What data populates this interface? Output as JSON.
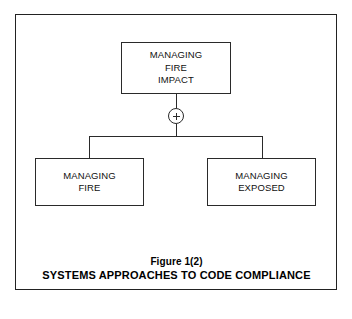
{
  "figure": {
    "caption_figure_number": "Figure 1(2)",
    "caption_title": "SYSTEMS APPROACHES TO CODE COMPLIANCE",
    "top_edge_remnant": "",
    "border_color": "#222222",
    "line_color": "#2a2a2a",
    "background_color": "#ffffff"
  },
  "nodes": {
    "top": {
      "name": "managing-fire-impact",
      "line1": "MANAGING",
      "line2": "FIRE",
      "line3": "IMPACT"
    },
    "left": {
      "name": "managing-fire",
      "line1": "MANAGING",
      "line2": "FIRE"
    },
    "right": {
      "name": "managing-exposed",
      "line1": "MANAGING",
      "line2": "EXPOSED"
    }
  },
  "operator": {
    "symbol": "+",
    "label": "plus-junction"
  }
}
